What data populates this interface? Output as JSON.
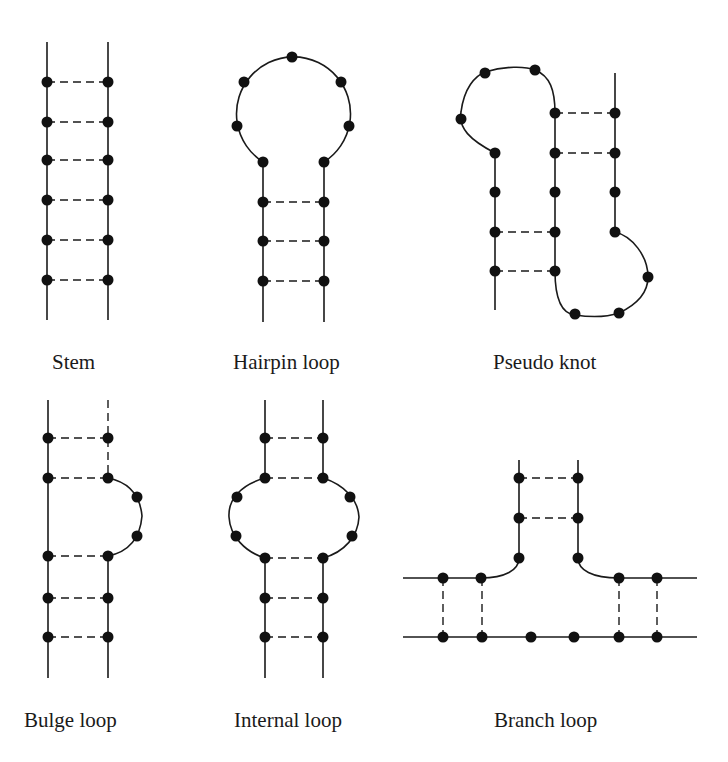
{
  "figure": {
    "panels": [
      {
        "id": "stem",
        "label": "Stem",
        "label_pos": [
          52,
          352
        ],
        "strands": [
          "M47 42 L47 320",
          "M108 42 L108 320"
        ],
        "pairs": [
          [
            47,
            82,
            108,
            82
          ],
          [
            47,
            122,
            108,
            122
          ],
          [
            47,
            160,
            108,
            160
          ],
          [
            47,
            200,
            108,
            200
          ],
          [
            47,
            240,
            108,
            240
          ],
          [
            47,
            280,
            108,
            280
          ]
        ],
        "bases": [
          [
            47,
            82
          ],
          [
            47,
            122
          ],
          [
            47,
            160
          ],
          [
            47,
            200
          ],
          [
            47,
            240
          ],
          [
            47,
            280
          ],
          [
            108,
            82
          ],
          [
            108,
            122
          ],
          [
            108,
            160
          ],
          [
            108,
            200
          ],
          [
            108,
            240
          ],
          [
            108,
            280
          ]
        ]
      },
      {
        "id": "hairpin-loop",
        "label": "Hairpin loop",
        "label_pos": [
          233,
          352
        ],
        "strands": [
          "M263 322 L263 162 A57 57 0 1 1 324 162 L324 322"
        ],
        "pairs": [
          [
            263,
            202,
            324,
            202
          ],
          [
            263,
            241,
            324,
            241
          ],
          [
            263,
            281,
            324,
            281
          ]
        ],
        "bases": [
          [
            292,
            57
          ],
          [
            244,
            82
          ],
          [
            341,
            82
          ],
          [
            237,
            126
          ],
          [
            349,
            126
          ],
          [
            263,
            162
          ],
          [
            324,
            162
          ],
          [
            263,
            202
          ],
          [
            263,
            241
          ],
          [
            263,
            281
          ],
          [
            324,
            202
          ],
          [
            324,
            241
          ],
          [
            324,
            281
          ]
        ]
      },
      {
        "id": "pseudo-knot",
        "label": "Pseudo knot",
        "label_pos": [
          493,
          352
        ],
        "strands": [
          "M495 310 L495 153 C470 140 458 128 461 112 C464 88 475 76 485 72 C505 66 525 66 535 70 C550 76 555 90 555 113 L555 271 C555 305 565 314 575 315 C595 318 610 316 619 313 C640 303 648 290 648 277 C648 256 632 236 615 232 L615 73"
        ],
        "pairs": [
          [
            555,
            113,
            615,
            113
          ],
          [
            555,
            153,
            615,
            153
          ],
          [
            495,
            232,
            555,
            232
          ],
          [
            495,
            271,
            555,
            271
          ]
        ],
        "bases": [
          [
            485,
            73
          ],
          [
            535,
            70
          ],
          [
            461,
            119
          ],
          [
            495,
            153
          ],
          [
            495,
            192
          ],
          [
            495,
            232
          ],
          [
            495,
            271
          ],
          [
            555,
            113
          ],
          [
            555,
            153
          ],
          [
            555,
            192
          ],
          [
            555,
            232
          ],
          [
            555,
            271
          ],
          [
            615,
            113
          ],
          [
            615,
            153
          ],
          [
            615,
            192
          ],
          [
            615,
            232
          ],
          [
            648,
            277
          ],
          [
            619,
            313
          ],
          [
            575,
            314
          ]
        ]
      },
      {
        "id": "bulge-loop",
        "label": "Bulge loop",
        "label_pos": [
          24,
          710
        ],
        "strands": [
          "M48 400 L48 678",
          "M108 478 C128 482 140 494 142 516 C140 540 128 552 108 556 L108 678"
        ],
        "dashed_strands": [
          "M108 400 L108 478"
        ],
        "pairs": [
          [
            48,
            438,
            108,
            438
          ],
          [
            48,
            478,
            108,
            478
          ],
          [
            48,
            556,
            108,
            556
          ],
          [
            48,
            598,
            108,
            598
          ],
          [
            48,
            637,
            108,
            637
          ]
        ],
        "bases": [
          [
            48,
            438
          ],
          [
            48,
            478
          ],
          [
            48,
            556
          ],
          [
            48,
            598
          ],
          [
            48,
            637
          ],
          [
            108,
            438
          ],
          [
            108,
            478
          ],
          [
            137,
            497
          ],
          [
            137,
            536
          ],
          [
            108,
            556
          ],
          [
            108,
            598
          ],
          [
            108,
            637
          ]
        ]
      },
      {
        "id": "internal-loop",
        "label": "Internal loop",
        "label_pos": [
          234,
          710
        ],
        "strands": [
          "M265 400 L265 478 C240 485 228 500 229 517 C230 536 245 552 265 558 L265 678",
          "M323 400 L323 478 C345 485 358 500 359 517 C358 536 345 552 323 558 L323 678"
        ],
        "pairs": [
          [
            265,
            438,
            323,
            438
          ],
          [
            265,
            478,
            323,
            478
          ],
          [
            265,
            558,
            323,
            558
          ],
          [
            265,
            598,
            323,
            598
          ],
          [
            265,
            637,
            323,
            637
          ]
        ],
        "bases": [
          [
            265,
            438
          ],
          [
            265,
            478
          ],
          [
            237,
            497
          ],
          [
            236,
            536
          ],
          [
            265,
            558
          ],
          [
            265,
            598
          ],
          [
            265,
            637
          ],
          [
            323,
            438
          ],
          [
            323,
            478
          ],
          [
            350,
            497
          ],
          [
            352,
            536
          ],
          [
            323,
            558
          ],
          [
            323,
            598
          ],
          [
            323,
            637
          ]
        ]
      },
      {
        "id": "branch-loop",
        "label": "Branch loop",
        "label_pos": [
          494,
          710
        ],
        "strands": [
          "M403 578 L481 578 C505 578 519 570 519 558 L519 460",
          "M578 460 L578 558 C578 570 592 578 619 578 L697 578",
          "M403 637 L697 637"
        ],
        "pairs": [
          [
            519,
            478,
            578,
            478
          ],
          [
            519,
            518,
            578,
            518
          ],
          [
            443,
            578,
            443,
            637
          ],
          [
            482,
            578,
            482,
            637
          ],
          [
            619,
            578,
            619,
            637
          ],
          [
            657,
            578,
            657,
            637
          ]
        ],
        "bases": [
          [
            519,
            478
          ],
          [
            519,
            518
          ],
          [
            519,
            558
          ],
          [
            578,
            478
          ],
          [
            578,
            518
          ],
          [
            578,
            558
          ],
          [
            443,
            578
          ],
          [
            481,
            578
          ],
          [
            619,
            578
          ],
          [
            657,
            578
          ],
          [
            443,
            637
          ],
          [
            482,
            637
          ],
          [
            531,
            637
          ],
          [
            574,
            637
          ],
          [
            619,
            637
          ],
          [
            657,
            637
          ]
        ]
      }
    ],
    "style": {
      "background": "#ffffff",
      "ink": "#1a1a1a",
      "base_radius": 5.5
    }
  }
}
